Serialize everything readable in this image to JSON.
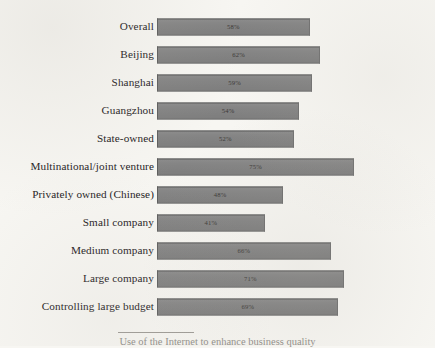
{
  "figure": {
    "caption": "Use of the Internet to enhance business quality",
    "value_suffix": "%"
  },
  "chart_data": {
    "type": "bar",
    "orientation": "horizontal",
    "title": "",
    "subtitle": "",
    "xlabel": "",
    "ylabel": "",
    "xlim": [
      0,
      100
    ],
    "grid": false,
    "legend": null,
    "bar_color": "#848484",
    "bar_border_color": "#5d5d5d",
    "background_color": "#f7f6f2",
    "value_labels_inside_bars": true,
    "categories": [
      "Overall",
      "Beijing",
      "Shanghai",
      "Guangzhou",
      "State-owned",
      "Multinational/joint venture",
      "Privately owned (Chinese)",
      "Small company",
      "Medium company",
      "Large company",
      "Controlling large budget"
    ],
    "values": [
      58,
      62,
      59,
      54,
      52,
      75,
      48,
      41,
      66,
      71,
      69
    ],
    "value_labels": [
      "58%",
      "62%",
      "59%",
      "54%",
      "52%",
      "75%",
      "48%",
      "41%",
      "66%",
      "71%",
      "69%"
    ]
  }
}
